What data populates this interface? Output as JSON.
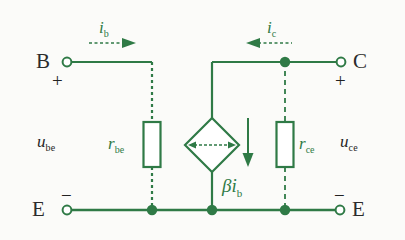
{
  "diagram": {
    "colors": {
      "wire_green": "#2f7a46",
      "label_black": "#1f1f1f",
      "background": "#fbfbf9"
    }
  },
  "terminals": {
    "base": {
      "label": "B",
      "polarity": "+",
      "node_style": "open-circle"
    },
    "collector": {
      "label": "C",
      "polarity": "+",
      "node_style": "open-circle"
    },
    "emitter_left": {
      "label": "E",
      "polarity": "−",
      "node_style": "open-circle"
    },
    "emitter_right": {
      "label": "E",
      "polarity": "−",
      "node_style": "open-circle"
    }
  },
  "voltages": {
    "input": {
      "symbol": "u",
      "sub": "be"
    },
    "output": {
      "symbol": "u",
      "sub": "ce"
    }
  },
  "currents": {
    "base_current": {
      "symbol": "i",
      "sub": "b",
      "arrow_direction": "right"
    },
    "collector_current": {
      "symbol": "i",
      "sub": "c",
      "arrow_direction": "left"
    }
  },
  "components": {
    "r_be": {
      "symbol": "r",
      "sub": "be",
      "type": "resistor",
      "orientation": "vertical"
    },
    "r_ce": {
      "symbol": "r",
      "sub": "ce",
      "type": "resistor",
      "orientation": "vertical"
    },
    "dependent_source": {
      "type": "current-controlled-current-source",
      "shape": "diamond",
      "value_symbol": "βi",
      "value_sub": "b",
      "arrow_direction": "down"
    }
  }
}
